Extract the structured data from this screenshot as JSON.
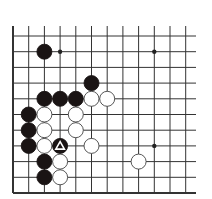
{
  "board": {
    "description": "Go problem diagram, lower-left corner region",
    "columns": 12,
    "rows": 11,
    "origin_x": 13,
    "origin_y": 36,
    "spacing": 15.7,
    "line_extend_right": 196,
    "line_top": 26,
    "left_edge": true,
    "bottom_edge": true,
    "colors": {
      "line": "#333333",
      "black_stone": "#1a1414",
      "white_stone": "#ffffff",
      "stone_outline": "#444444"
    },
    "star_points": [
      {
        "col": 3,
        "row": 1
      },
      {
        "col": 9,
        "row": 1
      },
      {
        "col": 9,
        "row": 7
      }
    ],
    "stones": [
      {
        "color": "black",
        "col": 2,
        "row": 1
      },
      {
        "color": "black",
        "col": 5,
        "row": 3
      },
      {
        "color": "black",
        "col": 2,
        "row": 4
      },
      {
        "color": "black",
        "col": 3,
        "row": 4
      },
      {
        "color": "black",
        "col": 4,
        "row": 4
      },
      {
        "color": "white",
        "col": 5,
        "row": 4
      },
      {
        "color": "white",
        "col": 6,
        "row": 4
      },
      {
        "color": "black",
        "col": 1,
        "row": 5
      },
      {
        "color": "white",
        "col": 2,
        "row": 5
      },
      {
        "color": "white",
        "col": 4,
        "row": 5
      },
      {
        "color": "black",
        "col": 1,
        "row": 6
      },
      {
        "color": "white",
        "col": 2,
        "row": 6
      },
      {
        "color": "white",
        "col": 4,
        "row": 6
      },
      {
        "color": "black",
        "col": 1,
        "row": 7
      },
      {
        "color": "white",
        "col": 2,
        "row": 7
      },
      {
        "color": "black",
        "col": 3,
        "row": 7,
        "marker": "triangle"
      },
      {
        "color": "white",
        "col": 5,
        "row": 7
      },
      {
        "color": "black",
        "col": 2,
        "row": 8
      },
      {
        "color": "white",
        "col": 3,
        "row": 8
      },
      {
        "color": "white",
        "col": 8,
        "row": 8
      },
      {
        "color": "black",
        "col": 2,
        "row": 9
      },
      {
        "color": "white",
        "col": 3,
        "row": 9
      }
    ]
  }
}
